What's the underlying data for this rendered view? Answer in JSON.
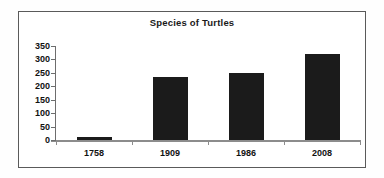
{
  "chart_data": {
    "type": "bar",
    "title": "Species of Turtles",
    "xlabel": "",
    "ylabel": "",
    "categories": [
      "1758",
      "1909",
      "1986",
      "2008"
    ],
    "values": [
      10,
      233,
      248,
      320
    ],
    "series": [
      {
        "name": "Species of Turtles",
        "values": [
          10,
          233,
          248,
          320
        ]
      }
    ],
    "ylim": [
      0,
      350
    ],
    "yticks": [
      0,
      50,
      100,
      150,
      200,
      250,
      300,
      350
    ],
    "ytick_labels": [
      "0",
      "50",
      "100",
      "150",
      "200",
      "250",
      "300",
      "350"
    ],
    "grid": false,
    "legend": false,
    "legend_position": "none",
    "bar_color": "#1b1b1b",
    "axis_color": "#8c8c8c",
    "frame_color": "#5a5a5a",
    "background_color": "#ffffff"
  }
}
